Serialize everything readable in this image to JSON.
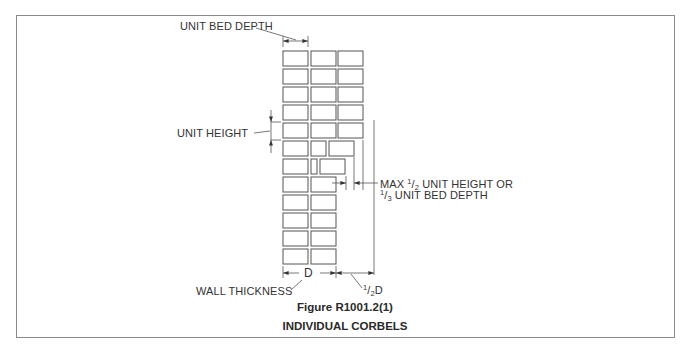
{
  "figure": {
    "number": "Figure R1001.2(1)",
    "title": "INDIVIDUAL CORBELS"
  },
  "labels": {
    "unit_bed_depth": "UNIT BED DEPTH",
    "unit_height": "UNIT HEIGHT",
    "max_line1_prefix": "MAX ",
    "max_line1_num": "1",
    "max_line1_den": "2",
    "max_line1_suffix": " UNIT HEIGHT OR",
    "max_line2_num": "1",
    "max_line2_den": "3",
    "max_line2_suffix": " UNIT BED DEPTH",
    "wall_thickness": "WALL THICKNESS",
    "d": "D",
    "half_d_num": "1",
    "half_d_den": "2",
    "half_d_suffix": "D"
  },
  "colors": {
    "line": "#555555",
    "frame": "#8a8a8a",
    "text": "#2a2a2a"
  },
  "brick_rows": [
    {
      "row": 1,
      "bricks": 3,
      "type": "full"
    },
    {
      "row": 2,
      "bricks": 3,
      "type": "full"
    },
    {
      "row": 3,
      "bricks": 3,
      "type": "full"
    },
    {
      "row": 4,
      "bricks": 3,
      "type": "full"
    },
    {
      "row": 5,
      "bricks": 3,
      "type": "full"
    },
    {
      "row": 6,
      "bricks": 3,
      "type": "corbel-1"
    },
    {
      "row": 7,
      "bricks": 3,
      "type": "corbel-2"
    },
    {
      "row": 8,
      "bricks": 2,
      "type": "wall"
    },
    {
      "row": 9,
      "bricks": 2,
      "type": "wall"
    },
    {
      "row": 10,
      "bricks": 2,
      "type": "wall"
    },
    {
      "row": 11,
      "bricks": 2,
      "type": "wall"
    },
    {
      "row": 12,
      "bricks": 2,
      "type": "wall"
    },
    {
      "row": 13,
      "bricks": 2,
      "type": "wall"
    }
  ]
}
